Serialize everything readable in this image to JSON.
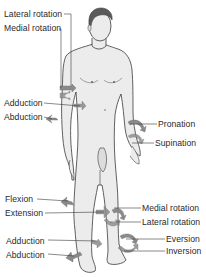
{
  "diagram": {
    "colors": {
      "skin": "#e9e9e9",
      "outline": "#3a3a3a",
      "hair": "#5a5a5a",
      "arrow": "#8a8a8a",
      "leader": "#3a3a3a",
      "label": "#2a2a2a"
    },
    "labels": {
      "shoulder_lateral_rotation": "Lateral rotation",
      "shoulder_medial_rotation": "Medial rotation",
      "hip_adduction": "Adduction",
      "hip_abduction": "Abduction",
      "forearm_pronation": "Pronation",
      "forearm_supination": "Supination",
      "knee_flexion": "Flexion",
      "knee_extension": "Extension",
      "leg_medial_rotation": "Medial rotation",
      "leg_lateral_rotation": "Lateral rotation",
      "ankle_adduction": "Adduction",
      "ankle_abduction": "Abduction",
      "foot_eversion": "Eversion",
      "foot_inversion": "Inversion"
    }
  }
}
